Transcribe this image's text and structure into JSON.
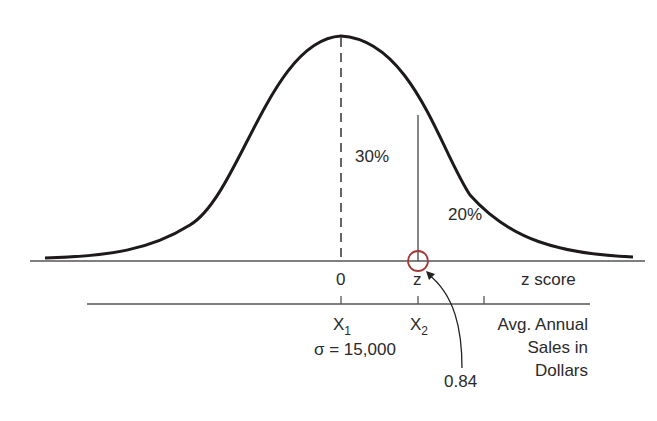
{
  "diagram": {
    "type": "normal-distribution",
    "colors": {
      "curve": "#1e1a1a",
      "axis": "#555555",
      "highlight_circle": "#a33a3a",
      "text": "#2a2a2a"
    },
    "regions": {
      "center_to_z": "30%",
      "right_tail": "20%"
    },
    "z_axis": {
      "label": "z score",
      "zero": "0",
      "z": "z"
    },
    "x_axis": {
      "x1": "X",
      "x1_sub": "1",
      "x2": "X",
      "x2_sub": "2",
      "sigma": "σ = 15,000",
      "label_line1": "Avg. Annual",
      "label_line2": "Sales in",
      "label_line3": "Dollars"
    },
    "annotation": {
      "z_value": "0.84"
    }
  }
}
